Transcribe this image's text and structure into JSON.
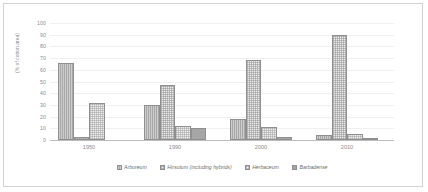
{
  "chart_data": {
    "type": "bar",
    "title": "",
    "subtitle": "",
    "xlabel": "",
    "ylabel": "(% of cotton area)",
    "ylim": [
      0,
      100
    ],
    "yticks": [
      0,
      10,
      20,
      30,
      40,
      50,
      60,
      70,
      80,
      90,
      100
    ],
    "grid": "horizontal",
    "legend_position": "bottom",
    "categories": [
      "1950",
      "1990",
      "2000",
      "2010"
    ],
    "series": [
      {
        "name": "Arboreum",
        "fill": "solid-gray-vertical-lines",
        "color": "#a8a8a8",
        "values": [
          66,
          30,
          18,
          4
        ]
      },
      {
        "name": "Hirsutum (including hybrids)",
        "fill": "light-checkered",
        "color": "#ebebeb",
        "values": [
          3,
          47,
          68,
          90
        ]
      },
      {
        "name": "Herbaceum",
        "fill": "light-checkered",
        "color": "#eeeeee",
        "values": [
          32,
          12,
          11,
          5
        ]
      },
      {
        "name": "Barbadense",
        "fill": "solid-gray",
        "color": "#a6a6a6",
        "values": [
          0,
          10,
          3,
          1
        ]
      }
    ]
  },
  "axes": {
    "y_tick_labels": [
      "100",
      "90",
      "80",
      "70",
      "60",
      "50",
      "40",
      "30",
      "20",
      "10",
      "0"
    ],
    "y_axis_title": "(% of cotton area)",
    "x_tick_labels": [
      "1950",
      "1990",
      "2000",
      "2010"
    ]
  },
  "legend": {
    "items": [
      {
        "label": "Arboreum"
      },
      {
        "label": "Hirsutum (including hybrids)"
      },
      {
        "label": "Herbaceum"
      },
      {
        "label": "Barbadense"
      }
    ]
  },
  "colors": {
    "frame": "#d2d2d2",
    "gridline": "#f0f0f0",
    "baseline": "#bdbdbd",
    "tick_text": "#8c8c8c",
    "legend_text": "#6e6e6e",
    "bar_outline": "#8f8f8f"
  }
}
